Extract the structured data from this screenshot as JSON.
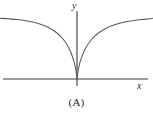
{
  "figure": {
    "caption": "(A)",
    "background_color": "#ffffff",
    "axis_color": "#3b3b3b",
    "curve_color": "#5a5a5a",
    "width": 153,
    "height": 120
  },
  "axes": {
    "x_label": "x",
    "y_label": "y",
    "x_axis": {
      "start_px": 3,
      "end_px": 148,
      "y_px": 79
    },
    "y_axis": {
      "top_px": 11,
      "bottom_px": 86,
      "x_px": 77
    },
    "origin": {
      "x_px": 77,
      "y_px": 79
    }
  },
  "chart_data": {
    "type": "line",
    "title": "",
    "subtitle": "",
    "xlabel": "x",
    "ylabel": "y",
    "grid": false,
    "legend": null,
    "annotations": [
      "(A)"
    ],
    "axis_style": "bare-cartesian-axes-no-ticks",
    "xlim": [
      -7.4,
      6.8
    ],
    "ylim": [
      0,
      3.4
    ],
    "series": [
      {
        "name": "cusp-curve",
        "x": [
          -7.4,
          -6.6,
          -5.8,
          -5.0,
          -4.2,
          -3.6,
          -3.0,
          -2.5,
          -2.0,
          -1.6,
          -1.2,
          -0.9,
          -0.6,
          -0.4,
          -0.25,
          -0.12,
          0.0,
          0.12,
          0.25,
          0.4,
          0.6,
          0.9,
          1.2,
          1.6,
          2.0,
          2.5,
          3.0,
          3.6,
          4.2,
          5.0,
          5.8,
          6.6,
          6.8
        ],
        "y": [
          3.15,
          3.12,
          3.08,
          3.02,
          2.94,
          2.85,
          2.73,
          2.59,
          2.41,
          2.22,
          1.97,
          1.72,
          1.39,
          1.09,
          0.82,
          0.5,
          0.0,
          0.5,
          0.82,
          1.09,
          1.39,
          1.72,
          1.97,
          2.22,
          2.41,
          2.59,
          2.73,
          2.85,
          2.94,
          3.02,
          3.08,
          3.12,
          3.15
        ]
      }
    ]
  }
}
